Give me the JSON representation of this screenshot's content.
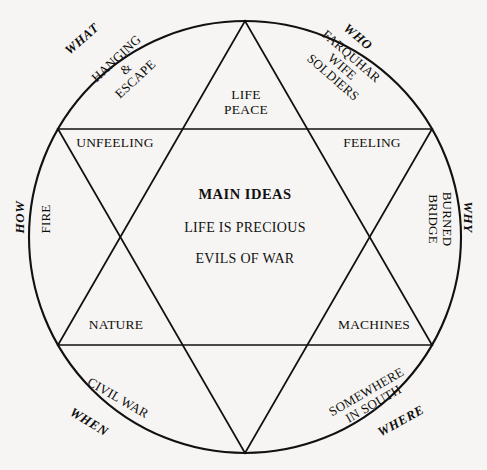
{
  "diagram": {
    "type": "hexagram-story-map",
    "shape": "circle-with-six-pointed-star",
    "background_color": "#f6f5f3",
    "line_color": "#111111",
    "center": {
      "title": "MAIN IDEAS",
      "lines": [
        "LIFE IS PRECIOUS",
        "EVILS OF WAR"
      ]
    },
    "segments": [
      {
        "id": "what",
        "question": "WHAT",
        "answer": "HANGING\n&\nESCAPE",
        "position": "top-left-arc"
      },
      {
        "id": "who",
        "question": "WHO",
        "answer": "FARQUHAR\nWIFE\nSOLDIERS",
        "position": "top-right-arc"
      },
      {
        "id": "how",
        "question": "HOW",
        "answer": "FIRE",
        "position": "left-arc"
      },
      {
        "id": "why",
        "question": "WHY",
        "answer": "BURNED\nBRIDGE",
        "position": "right-arc"
      },
      {
        "id": "when",
        "question": "WHEN",
        "answer": "CIVIL WAR",
        "position": "bottom-left-arc"
      },
      {
        "id": "where",
        "question": "WHERE",
        "answer": "SOMEWHERE\nIN SOUTH",
        "position": "bottom-right-arc"
      }
    ],
    "star_points": [
      {
        "id": "top",
        "text": "LIFE\nPEACE"
      },
      {
        "id": "upper-left",
        "text": "UNFEELING"
      },
      {
        "id": "upper-right",
        "text": "FEELING"
      },
      {
        "id": "lower-left",
        "text": "NATURE"
      },
      {
        "id": "lower-right",
        "text": "MACHINES"
      }
    ]
  }
}
